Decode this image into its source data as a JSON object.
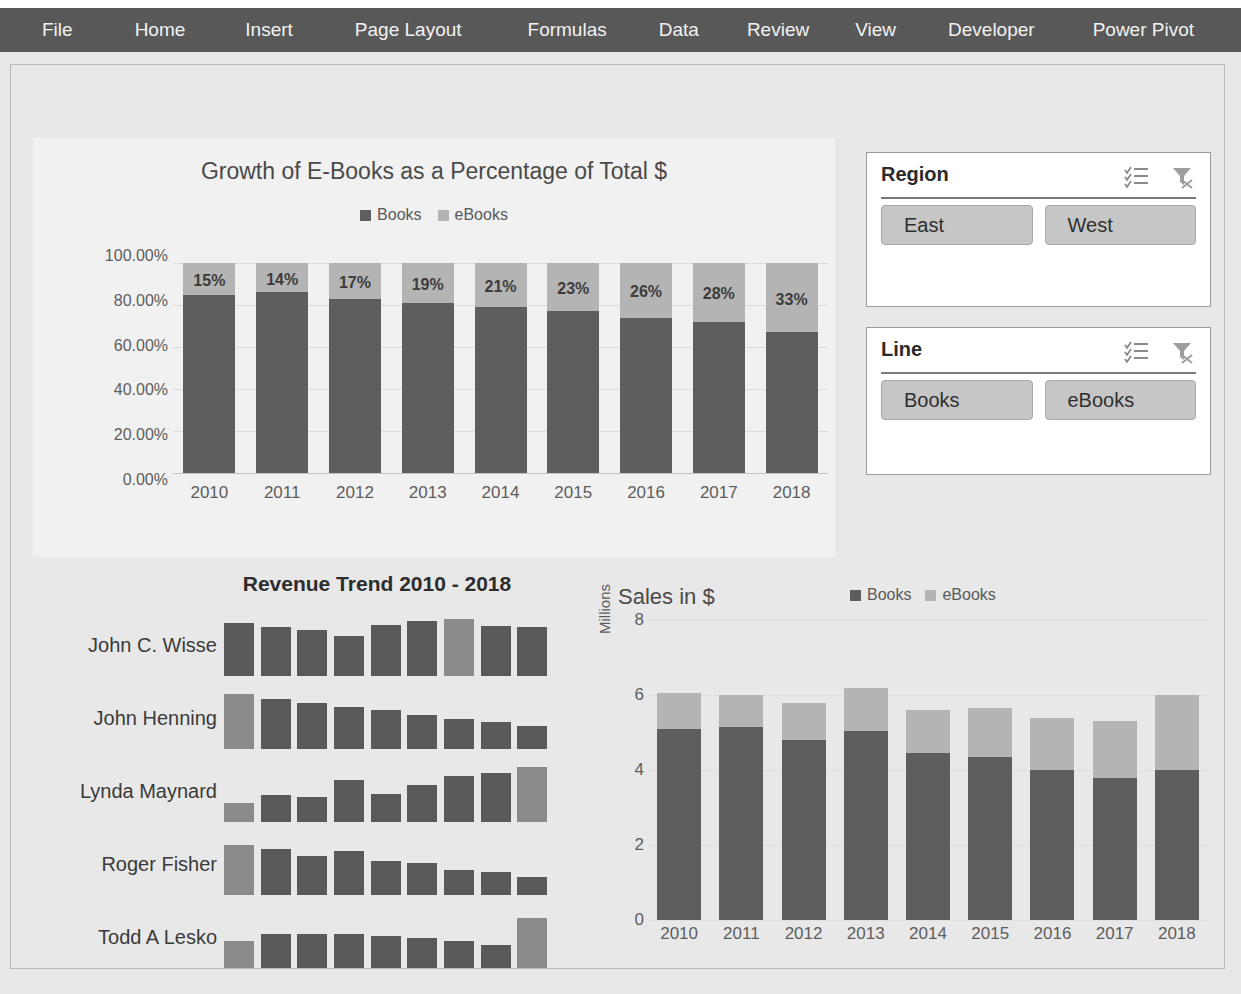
{
  "ribbon": {
    "tabs": [
      {
        "label": "File"
      },
      {
        "label": "Home"
      },
      {
        "label": "Insert"
      },
      {
        "label": "Page Layout"
      },
      {
        "label": "Formulas"
      },
      {
        "label": "Data"
      },
      {
        "label": "Review"
      },
      {
        "label": "View"
      },
      {
        "label": "Developer"
      },
      {
        "label": "Power Pivot"
      }
    ],
    "background": "#585858",
    "text_color": "#f2f2f2"
  },
  "slicers": [
    {
      "title": "Region",
      "multiselect_icon": "multi-select-icon",
      "clear_filter_icon": "clear-filter-icon",
      "items": [
        {
          "label": "East"
        },
        {
          "label": "West"
        }
      ]
    },
    {
      "title": "Line",
      "multiselect_icon": "multi-select-icon",
      "clear_filter_icon": "clear-filter-icon",
      "items": [
        {
          "label": "Books"
        },
        {
          "label": "eBooks"
        }
      ]
    }
  ],
  "colors": {
    "books": "#5e5e5e",
    "ebooks": "#b4b4b4",
    "ribbon": "#585858",
    "sheet": "#e8e8e8",
    "chart_panel": "#f1f1f1",
    "slicer_button": "#c6c6c6"
  },
  "chart_data": [
    {
      "id": "growth-of-ebooks",
      "type": "bar",
      "stacked": "percent",
      "title": "Growth of E-Books as a Percentage of Total $",
      "xlabel": "",
      "ylabel": "",
      "ylim": [
        0,
        100
      ],
      "yticks": [
        "0.00%",
        "20.00%",
        "40.00%",
        "60.00%",
        "80.00%",
        "100.00%"
      ],
      "grid": true,
      "legend": [
        "Books",
        "eBooks"
      ],
      "legend_position": "top",
      "categories": [
        "2010",
        "2011",
        "2012",
        "2013",
        "2014",
        "2015",
        "2016",
        "2017",
        "2018"
      ],
      "series": [
        {
          "name": "Books",
          "values": [
            85,
            86,
            83,
            81,
            79,
            77,
            74,
            72,
            67
          ]
        },
        {
          "name": "eBooks",
          "values": [
            15,
            14,
            17,
            19,
            21,
            23,
            26,
            28,
            33
          ]
        }
      ],
      "data_labels": [
        "15%",
        "14%",
        "17%",
        "19%",
        "21%",
        "23%",
        "26%",
        "28%",
        "33%"
      ]
    },
    {
      "id": "revenue-trend-sparklines",
      "type": "bar",
      "title": "Revenue Trend 2010 - 2018",
      "grid": false,
      "legend": [],
      "categories": [
        "2010",
        "2011",
        "2012",
        "2013",
        "2014",
        "2015",
        "2016",
        "2017",
        "2018"
      ],
      "rows": [
        {
          "name": "John C. Wisse",
          "values": [
            60,
            55,
            52,
            45,
            58,
            62,
            64,
            57,
            55
          ],
          "highlight": [
            6
          ]
        },
        {
          "name": "John Henning",
          "values": [
            62,
            56,
            52,
            48,
            44,
            38,
            34,
            30,
            26
          ],
          "highlight": [
            0
          ]
        },
        {
          "name": "Lynda Maynard",
          "values": [
            22,
            30,
            28,
            48,
            32,
            42,
            52,
            55,
            62
          ],
          "highlight": [
            0,
            8
          ]
        },
        {
          "name": "Roger Fisher",
          "values": [
            56,
            52,
            44,
            50,
            38,
            36,
            28,
            26,
            20
          ],
          "highlight": [
            0
          ]
        },
        {
          "name": "Todd A Lesko",
          "values": [
            30,
            38,
            38,
            38,
            36,
            34,
            30,
            26,
            56
          ],
          "highlight": [
            0,
            8
          ]
        }
      ]
    },
    {
      "id": "sales-in-dollars",
      "type": "bar",
      "stacked": "value",
      "title": "Sales in $",
      "ylabel": "Millions",
      "xlabel": "",
      "ylim": [
        0,
        8
      ],
      "yticks": [
        "0",
        "2",
        "4",
        "6",
        "8"
      ],
      "grid": true,
      "legend": [
        "Books",
        "eBooks"
      ],
      "legend_position": "top",
      "categories": [
        "2010",
        "2011",
        "2012",
        "2013",
        "2014",
        "2015",
        "2016",
        "2017",
        "2018"
      ],
      "series": [
        {
          "name": "Books",
          "values": [
            5.1,
            5.15,
            4.8,
            5.05,
            4.45,
            4.35,
            4.0,
            3.8,
            4.0
          ]
        },
        {
          "name": "eBooks",
          "values": [
            0.95,
            0.85,
            1.0,
            1.15,
            1.15,
            1.3,
            1.4,
            1.5,
            2.0
          ]
        }
      ]
    }
  ]
}
